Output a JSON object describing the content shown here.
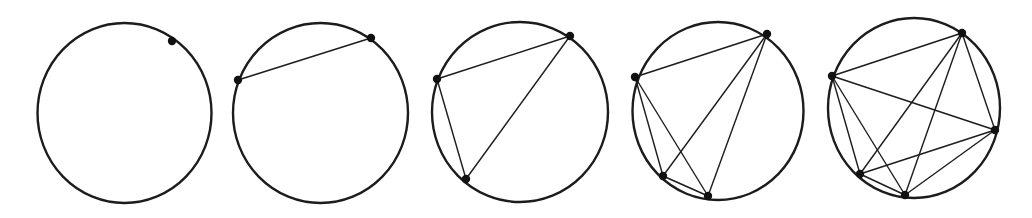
{
  "diagram": {
    "stroke_color": "#1c1c1c",
    "point_color": "#111111",
    "background": "#ffffff",
    "panels": [
      {
        "n_points": 1,
        "circle": {
          "cx": 124.5,
          "cy": 113,
          "rx": 87,
          "ry": 90
        },
        "points": [
          [
            172,
            41
          ]
        ],
        "chords": []
      },
      {
        "n_points": 2,
        "circle": {
          "cx": 320.5,
          "cy": 113,
          "rx": 87.5,
          "ry": 90
        },
        "points": [
          [
            238,
            80
          ],
          [
            371,
            38
          ]
        ],
        "chords": [
          [
            0,
            1
          ]
        ]
      },
      {
        "n_points": 3,
        "circle": {
          "cx": 520,
          "cy": 112,
          "rx": 88,
          "ry": 90
        },
        "points": [
          [
            437,
            79
          ],
          [
            570,
            36
          ],
          [
            466,
            179
          ]
        ],
        "chords": [
          [
            0,
            1
          ],
          [
            0,
            2
          ],
          [
            1,
            2
          ]
        ]
      },
      {
        "n_points": 4,
        "circle": {
          "cx": 718,
          "cy": 111,
          "rx": 85.5,
          "ry": 89
        },
        "points": [
          [
            635,
            77
          ],
          [
            767,
            34
          ],
          [
            663,
            176
          ],
          [
            708,
            196
          ]
        ],
        "chords": [
          [
            0,
            1
          ],
          [
            0,
            2
          ],
          [
            0,
            3
          ],
          [
            1,
            2
          ],
          [
            1,
            3
          ],
          [
            2,
            3
          ]
        ]
      },
      {
        "n_points": 5,
        "circle": {
          "cx": 914,
          "cy": 108,
          "rx": 86,
          "ry": 90
        },
        "points": [
          [
            832,
            76
          ],
          [
            962,
            33
          ],
          [
            995,
            130
          ],
          [
            860,
            174
          ],
          [
            905,
            195
          ]
        ],
        "chords": [
          [
            0,
            1
          ],
          [
            0,
            2
          ],
          [
            0,
            3
          ],
          [
            0,
            4
          ],
          [
            1,
            2
          ],
          [
            1,
            3
          ],
          [
            1,
            4
          ],
          [
            2,
            3
          ],
          [
            2,
            4
          ],
          [
            3,
            4
          ]
        ]
      }
    ]
  }
}
